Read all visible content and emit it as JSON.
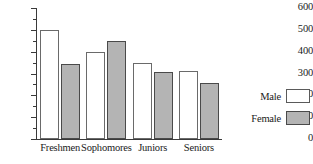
{
  "chart_data": {
    "type": "bar",
    "title": "",
    "xlabel": "",
    "ylabel": "",
    "ylim": [
      0,
      600
    ],
    "ytick_values": [
      600,
      500,
      400,
      300,
      200,
      100,
      0
    ],
    "ytick_labels": [
      "600",
      "500",
      "400",
      "300",
      "200",
      "100",
      "0"
    ],
    "minor_tick_step": 50,
    "grid": false,
    "legend_position": "right",
    "categories": [
      "Freshmen",
      "Sophomores",
      "Juniors",
      "Seniors"
    ],
    "series": [
      {
        "name": "Male",
        "color": "#ffffff",
        "values": [
          500,
          400,
          350,
          310
        ]
      },
      {
        "name": "Female",
        "color": "#b4b4b4",
        "values": [
          345,
          450,
          305,
          255
        ]
      }
    ]
  },
  "legend": {
    "items": [
      {
        "label": "Male",
        "swatch": "male"
      },
      {
        "label": "Female",
        "swatch": "female"
      }
    ]
  }
}
